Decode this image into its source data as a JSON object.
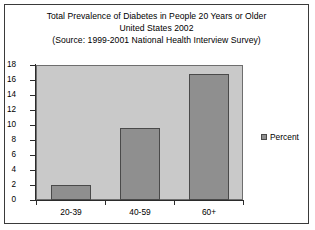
{
  "chart_data": {
    "type": "bar",
    "title": "Total Prevalence of Diabetes in People 20 Years or Older",
    "subtitle": "United States 2002",
    "source": "(Source: 1999-2001 National Health Interview Survey)",
    "categories": [
      "20-39",
      "40-59",
      "60+"
    ],
    "series": [
      {
        "name": "Percent",
        "values": [
          2.0,
          9.6,
          16.8
        ]
      }
    ],
    "values": [
      2.0,
      9.6,
      16.8
    ],
    "xlabel": "",
    "ylabel": "",
    "ylim": [
      0,
      18
    ],
    "ytick_step": 2,
    "yticks": [
      0,
      2,
      4,
      6,
      8,
      10,
      12,
      14,
      16,
      18
    ],
    "grid": false,
    "legend": {
      "position": "right",
      "entries": [
        "Percent"
      ]
    },
    "colors": {
      "bar_fill": "#8f8f8f",
      "bar_border": "#4a4a4a",
      "plot_background": "#c9c9c9",
      "frame_border": "#3a3a3a",
      "axis": "#2b2b2b",
      "text": "#000000",
      "page_background": "#ffffff"
    }
  }
}
